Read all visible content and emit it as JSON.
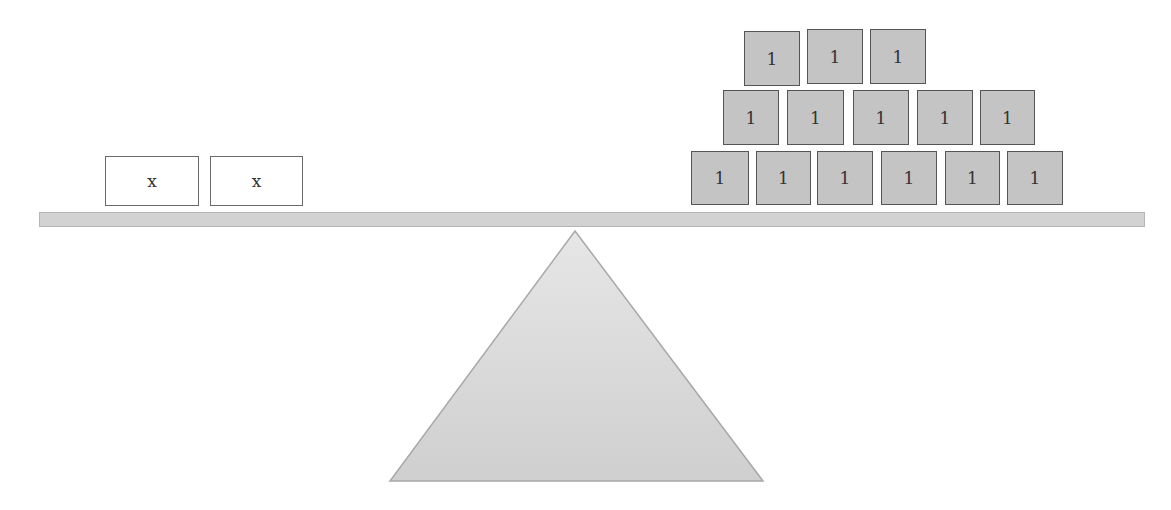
{
  "diagram": {
    "type": "balance-scale",
    "left_pan": {
      "blocks": [
        {
          "label": "x",
          "x": 105,
          "y": 156,
          "w": 94,
          "h": 50
        },
        {
          "label": "x",
          "x": 210,
          "y": 156,
          "w": 93,
          "h": 50
        }
      ]
    },
    "right_pan": {
      "rows": [
        {
          "row": "top",
          "blocks": [
            {
              "label": "1",
              "x": 744,
              "y": 31,
              "w": 56,
              "h": 55
            },
            {
              "label": "1",
              "x": 807,
              "y": 29,
              "w": 56,
              "h": 55
            },
            {
              "label": "1",
              "x": 870,
              "y": 29,
              "w": 56,
              "h": 55
            }
          ]
        },
        {
          "row": "middle",
          "blocks": [
            {
              "label": "1",
              "x": 723,
              "y": 90,
              "w": 56,
              "h": 55
            },
            {
              "label": "1",
              "x": 787,
              "y": 90,
              "w": 57,
              "h": 55
            },
            {
              "label": "1",
              "x": 853,
              "y": 90,
              "w": 56,
              "h": 55
            },
            {
              "label": "1",
              "x": 917,
              "y": 90,
              "w": 56,
              "h": 55
            },
            {
              "label": "1",
              "x": 980,
              "y": 90,
              "w": 55,
              "h": 55
            }
          ]
        },
        {
          "row": "bottom",
          "blocks": [
            {
              "label": "1",
              "x": 691,
              "y": 151,
              "w": 58,
              "h": 54
            },
            {
              "label": "1",
              "x": 756,
              "y": 151,
              "w": 55,
              "h": 54
            },
            {
              "label": "1",
              "x": 817,
              "y": 151,
              "w": 56,
              "h": 54
            },
            {
              "label": "1",
              "x": 881,
              "y": 151,
              "w": 56,
              "h": 54
            },
            {
              "label": "1",
              "x": 945,
              "y": 151,
              "w": 55,
              "h": 54
            },
            {
              "label": "1",
              "x": 1007,
              "y": 151,
              "w": 56,
              "h": 54
            }
          ]
        }
      ]
    },
    "counts": {
      "x_blocks": 2,
      "one_blocks": 14
    },
    "colors": {
      "x_block_fill": "#ffffff",
      "one_block_fill": "#c4c4c4",
      "beam": "#d2d2d2",
      "fulcrum": "#d6d6d6"
    }
  }
}
